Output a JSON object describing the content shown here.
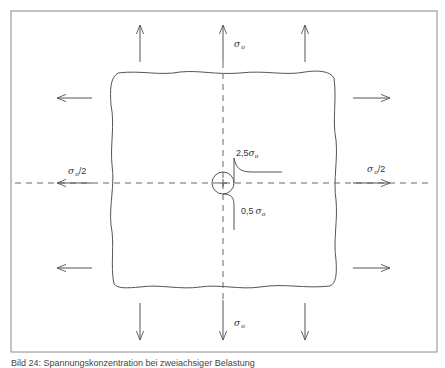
{
  "figure": {
    "caption": "Bild 24: Spannungskonzentration bei zweiachsiger Belastung",
    "labels": {
      "top_stress": "σ",
      "top_stress_sub": "o",
      "bottom_stress": "σ",
      "bottom_stress_sub": "o",
      "left_stress": "σ",
      "left_stress_sub": "o",
      "left_stress_suffix": "/2",
      "right_stress": "σ",
      "right_stress_sub": "o",
      "right_stress_suffix": "/2",
      "max_stress_factor": "2,5",
      "max_stress_sym": "σ",
      "max_stress_sub": "o",
      "min_stress_factor": "0,5",
      "min_stress_sym": "σ",
      "min_stress_sub": "o"
    },
    "colors": {
      "line": "#555555",
      "frame": "#888888",
      "background": "#ffffff"
    }
  }
}
